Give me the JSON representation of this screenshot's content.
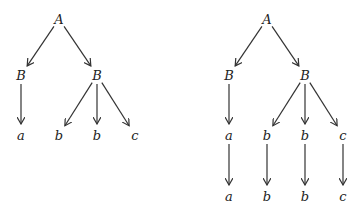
{
  "trees": [
    {
      "id": "left",
      "nodes": [
        {
          "id": "A",
          "label": "A",
          "x": 59,
          "y": 19
        },
        {
          "id": "B1",
          "label": "B",
          "x": 21,
          "y": 75
        },
        {
          "id": "B2",
          "label": "B",
          "x": 97,
          "y": 75
        },
        {
          "id": "a",
          "label": "a",
          "x": 21,
          "y": 135
        },
        {
          "id": "b1",
          "label": "b",
          "x": 59,
          "y": 135
        },
        {
          "id": "b2",
          "label": "b",
          "x": 97,
          "y": 135
        },
        {
          "id": "c",
          "label": "c",
          "x": 135,
          "y": 135
        }
      ],
      "edges": [
        [
          "A",
          "B1"
        ],
        [
          "A",
          "B2"
        ],
        [
          "B1",
          "a"
        ],
        [
          "B2",
          "b1"
        ],
        [
          "B2",
          "b2"
        ],
        [
          "B2",
          "c"
        ]
      ]
    },
    {
      "id": "right",
      "nodes": [
        {
          "id": "A",
          "label": "A",
          "x": 267,
          "y": 19
        },
        {
          "id": "B1",
          "label": "B",
          "x": 229,
          "y": 75
        },
        {
          "id": "B2",
          "label": "B",
          "x": 305,
          "y": 75
        },
        {
          "id": "a",
          "label": "a",
          "x": 229,
          "y": 135
        },
        {
          "id": "b1",
          "label": "b",
          "x": 267,
          "y": 135
        },
        {
          "id": "b2",
          "label": "b",
          "x": 305,
          "y": 135
        },
        {
          "id": "c",
          "label": "c",
          "x": 343,
          "y": 135
        },
        {
          "id": "a2",
          "label": "a",
          "x": 229,
          "y": 196
        },
        {
          "id": "b3",
          "label": "b",
          "x": 267,
          "y": 196
        },
        {
          "id": "b4",
          "label": "b",
          "x": 305,
          "y": 196
        },
        {
          "id": "c2",
          "label": "c",
          "x": 343,
          "y": 196
        }
      ],
      "edges": [
        [
          "A",
          "B1"
        ],
        [
          "A",
          "B2"
        ],
        [
          "B1",
          "a"
        ],
        [
          "B2",
          "b1"
        ],
        [
          "B2",
          "b2"
        ],
        [
          "B2",
          "c"
        ],
        [
          "a",
          "a2"
        ],
        [
          "b1",
          "b3"
        ],
        [
          "b2",
          "b4"
        ],
        [
          "c",
          "c2"
        ]
      ]
    }
  ]
}
